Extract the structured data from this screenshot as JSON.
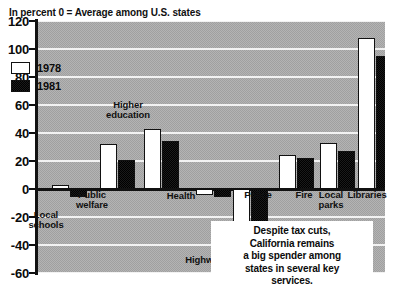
{
  "header_note": "In percent\n0 = Average among U.S. states",
  "callout": "Despite tax cuts,\nCalifornia remains\na big spender among\nstates in several key\nservices.",
  "legend": {
    "items": [
      {
        "label": "1978",
        "color": "#ffffff",
        "swatch": "open-square-swatch"
      },
      {
        "label": "1981",
        "color": "#111111",
        "swatch": "filled-square-swatch"
      }
    ]
  },
  "axis": {
    "y_ticks": [
      "120",
      "100",
      "80",
      "60",
      "40",
      "20",
      "0",
      "-20",
      "-40",
      "-60"
    ],
    "y_tick_values": [
      120,
      100,
      80,
      60,
      40,
      20,
      0,
      -20,
      -40,
      -60
    ]
  },
  "chart_data": {
    "type": "bar",
    "title": "",
    "subtitle": "In percent  /  0 = Average among U.S. states",
    "xlabel": "",
    "ylabel": "In percent",
    "ylim": [
      -60,
      120
    ],
    "grid": true,
    "legend_position": "upper-left-inside",
    "categories": [
      "Local schools",
      "Public welfare",
      "Higher education",
      "Health",
      "Highways",
      "Police",
      "Fire",
      "Local parks",
      "Libraries"
    ],
    "series": [
      {
        "name": "1978",
        "values": [
          3,
          32,
          43,
          -4,
          -40,
          24,
          33,
          108,
          41
        ]
      },
      {
        "name": "1981",
        "values": [
          -6,
          21,
          34,
          -6,
          -44,
          22,
          27,
          95,
          9
        ]
      }
    ]
  },
  "cat_labels": [
    {
      "text": "Local\nschools",
      "x": 18,
      "y": 210
    },
    {
      "text": "Public\nwelfare",
      "x": 64,
      "y": 190
    },
    {
      "text": "Higher\neducation",
      "x": 100,
      "y": 100
    },
    {
      "text": "Health",
      "x": 153,
      "y": 191
    },
    {
      "text": "Highways",
      "x": 179,
      "y": 255
    },
    {
      "text": "Police",
      "x": 230,
      "y": 190
    },
    {
      "text": "Fire",
      "x": 276,
      "y": 190
    },
    {
      "text": "Local\nparks",
      "x": 303,
      "y": 190
    },
    {
      "text": "Libraries",
      "x": 339,
      "y": 190
    }
  ]
}
